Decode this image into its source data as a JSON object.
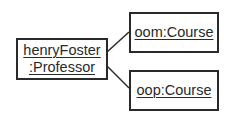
{
  "diagram": {
    "type": "UML object diagram",
    "objects": [
      {
        "id": "henryFoster",
        "lines": [
          "henryFoster",
          ":Professor"
        ]
      },
      {
        "id": "oom",
        "lines": [
          "oom:Course"
        ]
      },
      {
        "id": "oop",
        "lines": [
          "oop:Course"
        ]
      }
    ],
    "links": [
      {
        "from": "henryFoster",
        "to": "oom"
      },
      {
        "from": "henryFoster",
        "to": "oop"
      }
    ],
    "colors": {
      "stroke": "#2a2a2a",
      "background": "#ffffff"
    }
  }
}
